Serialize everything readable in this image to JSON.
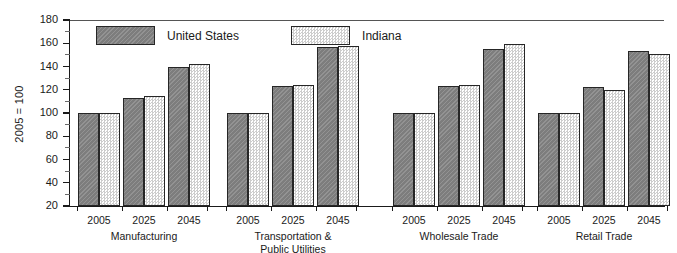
{
  "chart_data": {
    "type": "bar",
    "title": "",
    "subtitle": "",
    "xlabel": "",
    "ylabel": "2005 = 100",
    "ylim": [
      20,
      180
    ],
    "ytick_step": 20,
    "yminor_step": 10,
    "ytick_labels": [
      "180",
      "160",
      "140",
      "120",
      "100",
      "80",
      "60",
      "40",
      "20"
    ],
    "ytick_values": [
      180,
      160,
      140,
      120,
      100,
      80,
      60,
      40,
      20
    ],
    "grid": false,
    "legend_position": "top-left-inside",
    "x_sublabels": [
      "2005",
      "2025",
      "2045"
    ],
    "categories": [
      "Manufacturing",
      "Transportation &\nPublic Utilities",
      "Wholesale Trade",
      "Retail Trade"
    ],
    "category_lines": [
      [
        "Manufacturing"
      ],
      [
        "Transportation &",
        "Public Utilities"
      ],
      [
        "Wholesale Trade"
      ],
      [
        "Retail Trade"
      ]
    ],
    "series": [
      {
        "name": "United States",
        "color": "#7d7d7d",
        "pattern": "solid-gray",
        "values_by_category": [
          [
            100,
            113,
            140
          ],
          [
            100,
            123,
            157
          ],
          [
            100,
            123,
            155
          ],
          [
            100,
            122,
            153
          ]
        ]
      },
      {
        "name": "Indiana",
        "color": "#e9e9e9",
        "pattern": "dotted-light",
        "values_by_category": [
          [
            100,
            115,
            142
          ],
          [
            100,
            124,
            158
          ],
          [
            100,
            124,
            159
          ],
          [
            100,
            120,
            151
          ]
        ]
      }
    ]
  },
  "legend": {
    "items": [
      {
        "label": "United States"
      },
      {
        "label": "Indiana"
      }
    ]
  },
  "colors": {
    "series_us": "#7d7d7d",
    "series_in": "#e9e9e9",
    "axis": "#1a1a1a",
    "background": "#ffffff"
  }
}
